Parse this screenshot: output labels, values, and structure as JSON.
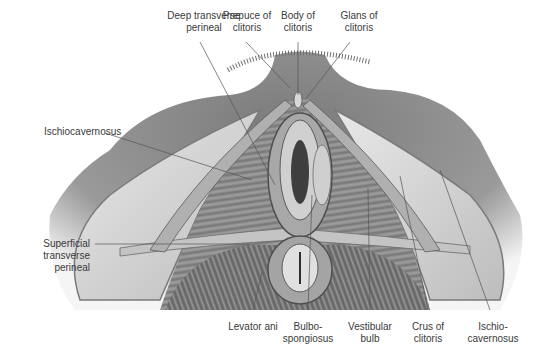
{
  "figure": {
    "colors": {
      "background": "#ffffff",
      "label_text": "#3a3a3a",
      "leader_line": "#555555",
      "skin": "#8f8f8f",
      "muscle": "#9a9a9a",
      "fat": "#dcdcdc"
    }
  },
  "labels": {
    "top": [
      {
        "id": "deep-transverse-perineal",
        "text": "Deep transverse\nperineal"
      },
      {
        "id": "prepuce-of-clitoris",
        "text": "Prepuce of\nclitoris"
      },
      {
        "id": "body-of-clitoris",
        "text": "Body of\nclitoris"
      },
      {
        "id": "glans-of-clitoris",
        "text": "Glans of\nclitoris"
      }
    ],
    "left": [
      {
        "id": "ischiocavernosus-left",
        "text": "Ischiocavernosus"
      },
      {
        "id": "superficial-transverse-perineal",
        "text": "Superficial\ntransverse\nperineal"
      }
    ],
    "bottom": [
      {
        "id": "levator-ani",
        "text": "Levator ani"
      },
      {
        "id": "bulbospongiosus",
        "text": "Bulbo-\nspongiosus"
      },
      {
        "id": "vestibular-bulb",
        "text": "Vestibular\nbulb"
      },
      {
        "id": "crus-of-clitoris",
        "text": "Crus of\nclitoris"
      },
      {
        "id": "ischiocavernosus-right",
        "text": "Ischio-\ncavernosus"
      }
    ]
  }
}
